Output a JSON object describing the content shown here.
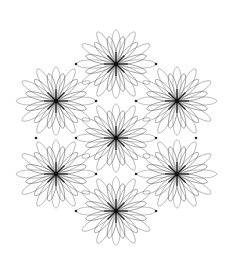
{
  "figure": {
    "background": "#ffffff",
    "stroke_color": "#555555",
    "center_color": "#111111",
    "dot_color": "#222222",
    "width": 228,
    "height": 261
  },
  "flowers": [
    {
      "id": "top",
      "cx": 116,
      "cy": 64
    },
    {
      "id": "upper-left",
      "cx": 56,
      "cy": 101
    },
    {
      "id": "upper-right",
      "cx": 177,
      "cy": 101
    },
    {
      "id": "middle",
      "cx": 116,
      "cy": 138
    },
    {
      "id": "lower-left",
      "cx": 56,
      "cy": 174
    },
    {
      "id": "lower-right",
      "cx": 177,
      "cy": 174
    },
    {
      "id": "bottom",
      "cx": 116,
      "cy": 211
    }
  ],
  "petals": {
    "outer": {
      "count": 12,
      "length": 38,
      "width": 5.5,
      "opacity": 0.55,
      "offset_deg": 0
    },
    "inner": {
      "count": 12,
      "length": 30,
      "width": 4.5,
      "opacity": 0.7,
      "offset_deg": 15
    },
    "core": {
      "count": 8,
      "length": 12,
      "width": 1.2,
      "opacity": 0.9,
      "offset_deg": 0
    }
  },
  "dots": [
    {
      "x": 76,
      "y": 64
    },
    {
      "x": 156,
      "y": 64
    },
    {
      "x": 96,
      "y": 101
    },
    {
      "x": 136,
      "y": 101
    },
    {
      "x": 36,
      "y": 138
    },
    {
      "x": 76,
      "y": 138
    },
    {
      "x": 156,
      "y": 138
    },
    {
      "x": 196,
      "y": 138
    },
    {
      "x": 96,
      "y": 174
    },
    {
      "x": 136,
      "y": 174
    },
    {
      "x": 76,
      "y": 211
    },
    {
      "x": 156,
      "y": 211
    }
  ]
}
